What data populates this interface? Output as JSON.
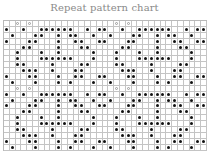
{
  "title": "Repeat pattern chart",
  "grid": {
    "columns": 35,
    "rows": 22,
    "tile_width": 17,
    "tile_height": 11,
    "dot_color": "#111111",
    "line_color": "#c4c4c4",
    "symbols": {
      "dot": "filled-circle",
      "mark": "light-circle"
    },
    "tile": {
      "marks": [
        [
          0,
          2
        ],
        [
          0,
          4
        ]
      ],
      "dots": [
        [
          1,
          0
        ],
        [
          1,
          3
        ],
        [
          1,
          6
        ],
        [
          1,
          7
        ],
        [
          1,
          8
        ],
        [
          1,
          9
        ],
        [
          1,
          10
        ],
        [
          1,
          11
        ],
        [
          1,
          14
        ],
        [
          1,
          16
        ],
        [
          2,
          1
        ],
        [
          2,
          5
        ],
        [
          2,
          6
        ],
        [
          2,
          9
        ],
        [
          2,
          11
        ],
        [
          2,
          12
        ],
        [
          2,
          15
        ],
        [
          3,
          0
        ],
        [
          3,
          4
        ],
        [
          3,
          5
        ],
        [
          3,
          9
        ],
        [
          3,
          12
        ],
        [
          3,
          13
        ],
        [
          3,
          16
        ],
        [
          4,
          3
        ],
        [
          4,
          4
        ],
        [
          4,
          9
        ],
        [
          4,
          13
        ],
        [
          4,
          14
        ],
        [
          5,
          2
        ],
        [
          5,
          6
        ],
        [
          5,
          9
        ],
        [
          5,
          15
        ],
        [
          6,
          2
        ],
        [
          6,
          6
        ],
        [
          6,
          7
        ],
        [
          6,
          8
        ],
        [
          6,
          9
        ],
        [
          6,
          10
        ],
        [
          6,
          11
        ],
        [
          6,
          15
        ],
        [
          7,
          2
        ],
        [
          7,
          3
        ],
        [
          7,
          8
        ],
        [
          7,
          13
        ],
        [
          7,
          14
        ],
        [
          8,
          3
        ],
        [
          8,
          4
        ],
        [
          8,
          5
        ],
        [
          8,
          8
        ],
        [
          8,
          12
        ],
        [
          8,
          13
        ],
        [
          9,
          0
        ],
        [
          9,
          4
        ],
        [
          9,
          5
        ],
        [
          9,
          9
        ],
        [
          9,
          12
        ],
        [
          9,
          13
        ],
        [
          9,
          16
        ],
        [
          10,
          1
        ],
        [
          10,
          5
        ],
        [
          10,
          9
        ],
        [
          10,
          11
        ],
        [
          10,
          15
        ]
      ]
    }
  }
}
